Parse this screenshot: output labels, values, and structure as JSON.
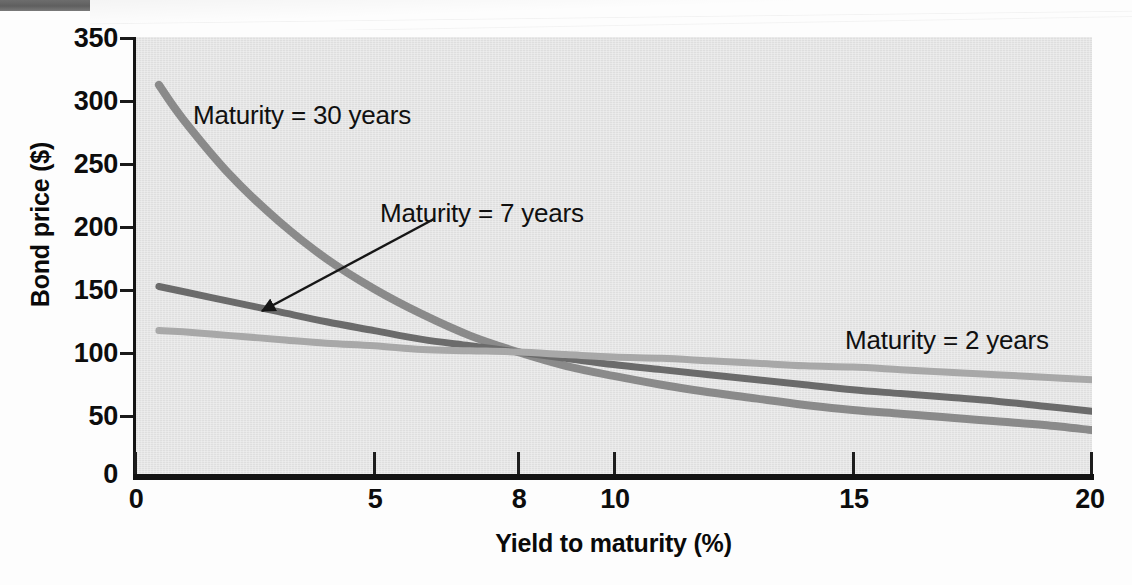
{
  "chart_data": {
    "type": "line",
    "title": "",
    "xlabel": "Yield to maturity (%)",
    "ylabel": "Bond price ($)",
    "xlim": [
      0,
      20
    ],
    "ylim": [
      0,
      350
    ],
    "xticks": [
      "0",
      "5",
      "8",
      "10",
      "15",
      "20"
    ],
    "xtick_values": [
      0,
      5,
      8,
      10,
      15,
      20
    ],
    "yticks": [
      "0",
      "50",
      "100",
      "150",
      "200",
      "250",
      "300",
      "350"
    ],
    "ytick_values": [
      0,
      50,
      100,
      150,
      200,
      250,
      300,
      350
    ],
    "grid": false,
    "legend_position": "inline-annotations",
    "background_color": "#e2e2e2",
    "annotations": [
      {
        "text": "Maturity = 30 years",
        "series": "Maturity = 30 years"
      },
      {
        "text": "Maturity = 7 years",
        "series": "Maturity = 7 years",
        "arrow": true
      },
      {
        "text": "Maturity = 2 years",
        "series": "Maturity = 2 years"
      }
    ],
    "series": [
      {
        "name": "Maturity = 30 years",
        "color": "#8a8a8a",
        "x": [
          0.5,
          1,
          2,
          3,
          4,
          5,
          6,
          7,
          8,
          9,
          10,
          11,
          12,
          13,
          14,
          15,
          16,
          17,
          18,
          19,
          20
        ],
        "values": [
          312,
          285,
          240,
          204,
          174,
          150,
          130,
          113,
          100,
          89,
          81,
          74,
          68,
          63,
          58,
          54,
          51,
          48,
          45,
          42,
          38
        ]
      },
      {
        "name": "Maturity = 7 years",
        "color": "#6b6b6b",
        "x": [
          0.5,
          1,
          2,
          3,
          4,
          5,
          6,
          7,
          8,
          9,
          10,
          11,
          12,
          13,
          14,
          15,
          16,
          17,
          18,
          19,
          20
        ],
        "values": [
          152,
          148,
          140,
          132,
          124,
          117,
          110,
          105,
          100,
          95,
          90,
          86,
          82,
          78,
          74,
          70,
          67,
          64,
          61,
          57,
          53
        ]
      },
      {
        "name": "Maturity = 2 years",
        "color": "#a8a8a8",
        "x": [
          0.5,
          1,
          2,
          3,
          4,
          5,
          6,
          7,
          8,
          9,
          10,
          11,
          12,
          13,
          14,
          15,
          16,
          17,
          18,
          19,
          20
        ],
        "values": [
          117,
          116,
          113,
          110,
          107,
          105,
          102,
          101,
          100,
          98,
          96,
          95,
          93,
          91,
          89,
          88,
          86,
          84,
          82,
          80,
          78
        ]
      }
    ]
  },
  "axes": {
    "y_title": "Bond price ($)",
    "x_title": "Yield to maturity (%)",
    "y_labels": [
      "350",
      "300",
      "250",
      "200",
      "150",
      "100",
      "50",
      "0"
    ],
    "x_labels": [
      "0",
      "5",
      "8",
      "10",
      "15",
      "20"
    ]
  },
  "labels": {
    "maturity_30": "Maturity = 30 years",
    "maturity_7": "Maturity = 7 years",
    "maturity_2": "Maturity = 2 years"
  }
}
